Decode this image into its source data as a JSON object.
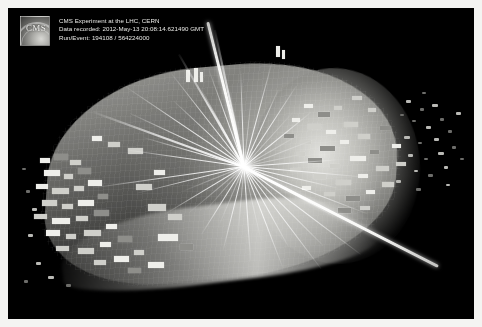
{
  "frame": {
    "border_color": "#f4f4f2",
    "canvas_background": "#000000"
  },
  "caption": {
    "logo_text": "CMS",
    "logo_name": "cms-logo",
    "line1": "CMS Experiment at the LHC, CERN",
    "line2": "Data recorded: 2012-May-13 20:08:14.621490 GMT",
    "line3": "Run/Event: 194108 / 564224000"
  },
  "event": {
    "experiment": "CMS",
    "facility": "LHC, CERN",
    "date_recorded": "2012-May-13",
    "time_recorded": "20:08:14.621490 GMT",
    "run_number": "194108",
    "event_number": "564224000"
  },
  "colors": {
    "track": "#ffffff",
    "deposit": "#cfcfca",
    "deposit_dim": "#8e8e8a",
    "deposit_bright": "#eeeeea",
    "barrel": "#b7b7b2",
    "background": "#000000",
    "caption_text": "#e9e9e6"
  },
  "scene": {
    "vertex": {
      "x": 236,
      "y": 158
    },
    "tracks": [
      {
        "a": 188,
        "l": 118,
        "w": 1
      },
      {
        "a": 172,
        "l": 152,
        "w": 1
      },
      {
        "a": 196,
        "l": 104,
        "w": 1
      },
      {
        "a": 205,
        "l": 126,
        "w": 1
      },
      {
        "a": 214,
        "l": 142,
        "w": 1
      },
      {
        "a": 223,
        "l": 96,
        "w": 1
      },
      {
        "a": 232,
        "l": 118,
        "w": 1
      },
      {
        "a": 241,
        "l": 88,
        "w": 1
      },
      {
        "a": 250,
        "l": 102,
        "w": 1
      },
      {
        "a": 259,
        "l": 78,
        "w": 1
      },
      {
        "a": 268,
        "l": 96,
        "w": 1
      },
      {
        "a": 276,
        "l": 72,
        "w": 1
      },
      {
        "a": 285,
        "l": 108,
        "w": 1
      },
      {
        "a": 294,
        "l": 84,
        "w": 1
      },
      {
        "a": 303,
        "l": 96,
        "w": 1
      },
      {
        "a": 312,
        "l": 74,
        "w": 1
      },
      {
        "a": 321,
        "l": 86,
        "w": 1
      },
      {
        "a": 330,
        "l": 64,
        "w": 1
      },
      {
        "a": 339,
        "l": 78,
        "w": 1
      },
      {
        "a": 348,
        "l": 58,
        "w": 1
      },
      {
        "a": 356,
        "l": 92,
        "w": 1
      },
      {
        "a": 5,
        "l": 118,
        "w": 1
      },
      {
        "a": 13,
        "l": 96,
        "w": 1
      },
      {
        "a": 21,
        "l": 132,
        "w": 1
      },
      {
        "a": 29,
        "l": 104,
        "w": 1
      },
      {
        "a": 37,
        "l": 146,
        "w": 1
      },
      {
        "a": 45,
        "l": 112,
        "w": 1
      },
      {
        "a": 53,
        "l": 128,
        "w": 1
      },
      {
        "a": 61,
        "l": 92,
        "w": 1
      },
      {
        "a": 69,
        "l": 108,
        "w": 1
      },
      {
        "a": 77,
        "l": 76,
        "w": 1
      },
      {
        "a": 86,
        "l": 94,
        "w": 1
      },
      {
        "a": 95,
        "l": 70,
        "w": 1
      },
      {
        "a": 104,
        "l": 86,
        "w": 1
      },
      {
        "a": 113,
        "l": 64,
        "w": 1
      },
      {
        "a": 122,
        "l": 80,
        "w": 1
      },
      {
        "a": 131,
        "l": 58,
        "w": 1
      },
      {
        "a": 140,
        "l": 72,
        "w": 1
      },
      {
        "a": 149,
        "l": 90,
        "w": 1
      },
      {
        "a": 158,
        "l": 66,
        "w": 1
      },
      {
        "a": 166,
        "l": 110,
        "w": 1
      },
      {
        "a": 240,
        "l": 130,
        "w": 2
      },
      {
        "a": 258,
        "l": 140,
        "w": 2
      },
      {
        "a": 200,
        "l": 160,
        "w": 2
      }
    ],
    "muons": [
      {
        "x": 236,
        "y": 158,
        "a": 27,
        "l": 218,
        "label": "muon-track-lower-right"
      },
      {
        "x": 236,
        "y": 158,
        "a": -104,
        "l": 150,
        "label": "muon-track-upper"
      }
    ],
    "deposits_left": [
      {
        "x": 32,
        "y": 150,
        "w": 10,
        "h": 5
      },
      {
        "x": 46,
        "y": 146,
        "w": 14,
        "h": 6
      },
      {
        "x": 62,
        "y": 152,
        "w": 11,
        "h": 5
      },
      {
        "x": 36,
        "y": 162,
        "w": 16,
        "h": 6
      },
      {
        "x": 56,
        "y": 166,
        "w": 9,
        "h": 5
      },
      {
        "x": 70,
        "y": 160,
        "w": 13,
        "h": 6
      },
      {
        "x": 28,
        "y": 176,
        "w": 12,
        "h": 5
      },
      {
        "x": 44,
        "y": 180,
        "w": 17,
        "h": 6
      },
      {
        "x": 66,
        "y": 178,
        "w": 10,
        "h": 5
      },
      {
        "x": 80,
        "y": 172,
        "w": 14,
        "h": 6
      },
      {
        "x": 34,
        "y": 192,
        "w": 15,
        "h": 6
      },
      {
        "x": 54,
        "y": 196,
        "w": 11,
        "h": 5
      },
      {
        "x": 70,
        "y": 192,
        "w": 16,
        "h": 6
      },
      {
        "x": 90,
        "y": 186,
        "w": 10,
        "h": 5
      },
      {
        "x": 26,
        "y": 206,
        "w": 13,
        "h": 5
      },
      {
        "x": 44,
        "y": 210,
        "w": 18,
        "h": 6
      },
      {
        "x": 68,
        "y": 208,
        "w": 12,
        "h": 5
      },
      {
        "x": 86,
        "y": 202,
        "w": 15,
        "h": 6
      },
      {
        "x": 38,
        "y": 222,
        "w": 14,
        "h": 6
      },
      {
        "x": 58,
        "y": 226,
        "w": 10,
        "h": 5
      },
      {
        "x": 76,
        "y": 222,
        "w": 17,
        "h": 6
      },
      {
        "x": 98,
        "y": 216,
        "w": 11,
        "h": 5
      },
      {
        "x": 48,
        "y": 238,
        "w": 13,
        "h": 5
      },
      {
        "x": 70,
        "y": 240,
        "w": 16,
        "h": 6
      },
      {
        "x": 92,
        "y": 234,
        "w": 11,
        "h": 5
      },
      {
        "x": 110,
        "y": 228,
        "w": 14,
        "h": 6
      },
      {
        "x": 86,
        "y": 252,
        "w": 12,
        "h": 5
      },
      {
        "x": 106,
        "y": 248,
        "w": 15,
        "h": 6
      },
      {
        "x": 126,
        "y": 242,
        "w": 10,
        "h": 5
      },
      {
        "x": 120,
        "y": 260,
        "w": 13,
        "h": 5
      },
      {
        "x": 140,
        "y": 254,
        "w": 16,
        "h": 6
      },
      {
        "x": 100,
        "y": 134,
        "w": 12,
        "h": 5
      },
      {
        "x": 120,
        "y": 140,
        "w": 15,
        "h": 6
      },
      {
        "x": 84,
        "y": 128,
        "w": 10,
        "h": 5
      },
      {
        "x": 140,
        "y": 196,
        "w": 18,
        "h": 7
      },
      {
        "x": 160,
        "y": 206,
        "w": 14,
        "h": 6
      },
      {
        "x": 150,
        "y": 226,
        "w": 20,
        "h": 7
      },
      {
        "x": 172,
        "y": 236,
        "w": 13,
        "h": 6
      },
      {
        "x": 128,
        "y": 176,
        "w": 16,
        "h": 6
      },
      {
        "x": 146,
        "y": 162,
        "w": 11,
        "h": 5
      }
    ],
    "deposits_right": [
      {
        "x": 296,
        "y": 96,
        "w": 9,
        "h": 4
      },
      {
        "x": 310,
        "y": 104,
        "w": 12,
        "h": 5
      },
      {
        "x": 326,
        "y": 98,
        "w": 8,
        "h": 4
      },
      {
        "x": 300,
        "y": 116,
        "w": 13,
        "h": 5
      },
      {
        "x": 318,
        "y": 122,
        "w": 10,
        "h": 4
      },
      {
        "x": 336,
        "y": 114,
        "w": 14,
        "h": 5
      },
      {
        "x": 292,
        "y": 132,
        "w": 11,
        "h": 4
      },
      {
        "x": 312,
        "y": 138,
        "w": 15,
        "h": 5
      },
      {
        "x": 332,
        "y": 132,
        "w": 9,
        "h": 4
      },
      {
        "x": 350,
        "y": 126,
        "w": 12,
        "h": 5
      },
      {
        "x": 300,
        "y": 150,
        "w": 14,
        "h": 5
      },
      {
        "x": 322,
        "y": 156,
        "w": 10,
        "h": 4
      },
      {
        "x": 342,
        "y": 148,
        "w": 16,
        "h": 5
      },
      {
        "x": 362,
        "y": 142,
        "w": 9,
        "h": 4
      },
      {
        "x": 306,
        "y": 166,
        "w": 12,
        "h": 5
      },
      {
        "x": 328,
        "y": 172,
        "w": 15,
        "h": 5
      },
      {
        "x": 350,
        "y": 166,
        "w": 10,
        "h": 4
      },
      {
        "x": 368,
        "y": 158,
        "w": 13,
        "h": 5
      },
      {
        "x": 316,
        "y": 184,
        "w": 11,
        "h": 4
      },
      {
        "x": 338,
        "y": 188,
        "w": 14,
        "h": 5
      },
      {
        "x": 358,
        "y": 182,
        "w": 9,
        "h": 4
      },
      {
        "x": 374,
        "y": 174,
        "w": 12,
        "h": 5
      },
      {
        "x": 330,
        "y": 200,
        "w": 13,
        "h": 5
      },
      {
        "x": 352,
        "y": 198,
        "w": 10,
        "h": 4
      },
      {
        "x": 284,
        "y": 110,
        "w": 8,
        "h": 4
      },
      {
        "x": 276,
        "y": 126,
        "w": 10,
        "h": 4
      },
      {
        "x": 288,
        "y": 144,
        "w": 9,
        "h": 4
      },
      {
        "x": 282,
        "y": 160,
        "w": 11,
        "h": 4
      },
      {
        "x": 294,
        "y": 178,
        "w": 9,
        "h": 4
      },
      {
        "x": 344,
        "y": 88,
        "w": 10,
        "h": 4
      },
      {
        "x": 360,
        "y": 100,
        "w": 8,
        "h": 4
      },
      {
        "x": 372,
        "y": 118,
        "w": 11,
        "h": 4
      },
      {
        "x": 384,
        "y": 136,
        "w": 9,
        "h": 4
      },
      {
        "x": 388,
        "y": 154,
        "w": 10,
        "h": 4
      }
    ],
    "far_hits": [
      {
        "x": 398,
        "y": 92,
        "w": 5,
        "h": 3
      },
      {
        "x": 412,
        "y": 100,
        "w": 4,
        "h": 3
      },
      {
        "x": 424,
        "y": 96,
        "w": 6,
        "h": 3
      },
      {
        "x": 404,
        "y": 112,
        "w": 4,
        "h": 2
      },
      {
        "x": 418,
        "y": 118,
        "w": 5,
        "h": 3
      },
      {
        "x": 432,
        "y": 110,
        "w": 4,
        "h": 3
      },
      {
        "x": 396,
        "y": 128,
        "w": 6,
        "h": 3
      },
      {
        "x": 410,
        "y": 134,
        "w": 4,
        "h": 2
      },
      {
        "x": 426,
        "y": 130,
        "w": 5,
        "h": 3
      },
      {
        "x": 440,
        "y": 122,
        "w": 4,
        "h": 3
      },
      {
        "x": 400,
        "y": 146,
        "w": 5,
        "h": 3
      },
      {
        "x": 416,
        "y": 150,
        "w": 4,
        "h": 2
      },
      {
        "x": 430,
        "y": 144,
        "w": 6,
        "h": 3
      },
      {
        "x": 444,
        "y": 138,
        "w": 4,
        "h": 3
      },
      {
        "x": 406,
        "y": 162,
        "w": 4,
        "h": 2
      },
      {
        "x": 420,
        "y": 166,
        "w": 5,
        "h": 3
      },
      {
        "x": 436,
        "y": 158,
        "w": 4,
        "h": 3
      },
      {
        "x": 392,
        "y": 106,
        "w": 4,
        "h": 2
      },
      {
        "x": 448,
        "y": 104,
        "w": 5,
        "h": 3
      },
      {
        "x": 452,
        "y": 150,
        "w": 4,
        "h": 2
      },
      {
        "x": 388,
        "y": 172,
        "w": 5,
        "h": 3
      },
      {
        "x": 414,
        "y": 84,
        "w": 4,
        "h": 2
      },
      {
        "x": 438,
        "y": 176,
        "w": 4,
        "h": 2
      },
      {
        "x": 408,
        "y": 180,
        "w": 5,
        "h": 3
      },
      {
        "x": 24,
        "y": 200,
        "w": 5,
        "h": 3
      },
      {
        "x": 18,
        "y": 182,
        "w": 4,
        "h": 3
      },
      {
        "x": 20,
        "y": 226,
        "w": 5,
        "h": 3
      },
      {
        "x": 14,
        "y": 160,
        "w": 4,
        "h": 2
      },
      {
        "x": 28,
        "y": 254,
        "w": 5,
        "h": 3
      },
      {
        "x": 16,
        "y": 272,
        "w": 4,
        "h": 3
      },
      {
        "x": 40,
        "y": 268,
        "w": 6,
        "h": 3
      },
      {
        "x": 58,
        "y": 276,
        "w": 5,
        "h": 3
      }
    ],
    "top_towers": [
      {
        "x": 178,
        "y": 62,
        "w": 4,
        "h": 12
      },
      {
        "x": 186,
        "y": 60,
        "w": 4,
        "h": 14
      },
      {
        "x": 192,
        "y": 64,
        "w": 3,
        "h": 10
      },
      {
        "x": 268,
        "y": 38,
        "w": 4,
        "h": 11
      },
      {
        "x": 274,
        "y": 42,
        "w": 3,
        "h": 9
      }
    ]
  }
}
